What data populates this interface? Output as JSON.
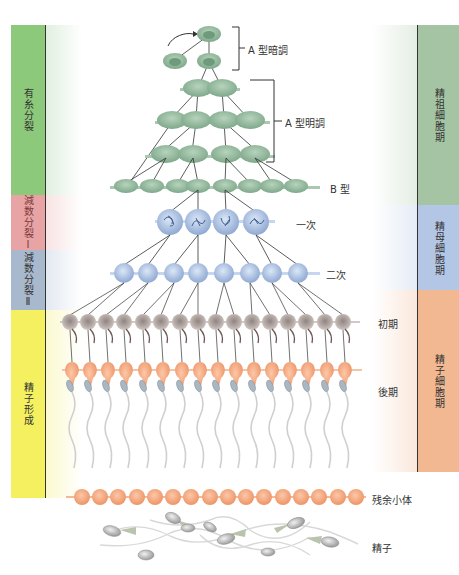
{
  "left_phases": [
    {
      "label": "有糸分裂",
      "color": "#8cc97a",
      "top": 25,
      "height": 170
    },
    {
      "label": "減数分裂Ⅰ",
      "color": "#e8a3a4",
      "top": 195,
      "height": 55
    },
    {
      "label": "減数分裂Ⅱ",
      "color": "#a9b9cd",
      "top": 250,
      "height": 60
    },
    {
      "label": "精子形成",
      "color": "#f4f060",
      "top": 310,
      "height": 188
    }
  ],
  "right_phases": [
    {
      "label": "精祖細胞期",
      "color": "#a5c4a3",
      "top": 25,
      "height": 180
    },
    {
      "label": "精母細胞期",
      "color": "#b4c6e6",
      "top": 205,
      "height": 85
    },
    {
      "label": "精子細胞期",
      "color": "#f1b892",
      "top": 290,
      "height": 182
    }
  ],
  "cell_labels": {
    "a_dark": "A 型暗調",
    "a_pale": "A 型明調",
    "b_type": "B 型",
    "primary": "一次",
    "secondary": "二次",
    "early": "初期",
    "late": "後期",
    "residual_body": "残余小体",
    "sperm": "精子"
  },
  "colors": {
    "spermatogonia": "#8fb89a",
    "spermatocyte": "#a9c4e8",
    "early_spermatid": "#b9a9a4",
    "late_spermatid": "#f2a57e",
    "residual": "#f09a72",
    "sperm_head": "#b8b8b8",
    "line": "#333333"
  }
}
